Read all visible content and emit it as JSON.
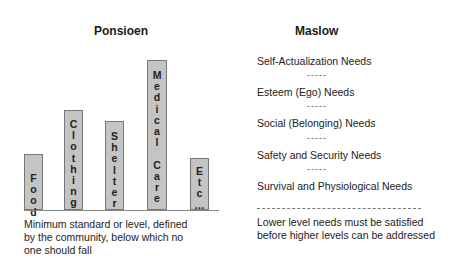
{
  "left": {
    "title": "Ponsioen",
    "bars": [
      {
        "label": "Food",
        "letters": [
          "F",
          "o",
          "o",
          "d"
        ]
      },
      {
        "label": "Clothing",
        "letters": [
          "C",
          "l",
          "o",
          "t",
          "h",
          "i",
          "n",
          "g"
        ]
      },
      {
        "label": "Shelter",
        "letters": [
          "S",
          "h",
          "e",
          "l",
          "t",
          "e",
          "r"
        ]
      },
      {
        "label": "Medical Care",
        "letters": [
          "M",
          "e",
          "d",
          "i",
          "c",
          "a",
          "l",
          "",
          "C",
          "a",
          "r",
          "e"
        ]
      },
      {
        "label": "Etc...",
        "letters": [
          "E",
          "t",
          "c",
          "…"
        ]
      }
    ],
    "caption": [
      "Minimum standard or level, defined",
      "by the community, below which no",
      "one should fall"
    ]
  },
  "right": {
    "title": "Maslow",
    "needs": [
      "Self-Actualization Needs",
      "Esteem (Ego) Needs",
      "Social (Belonging) Needs",
      "Safety and Security Needs",
      "Survival and Physiological Needs"
    ],
    "separator": "-----",
    "caption": [
      "Lower level needs must be satisfied",
      "before higher levels can be addressed"
    ]
  }
}
